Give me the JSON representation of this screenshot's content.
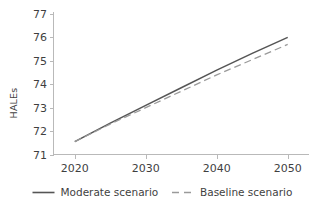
{
  "chart_data": {
    "type": "line",
    "title": "",
    "xlabel": "",
    "ylabel": "HALEs",
    "xlim": [
      2017,
      2053
    ],
    "ylim": [
      71,
      77
    ],
    "grid": false,
    "legend_position": "bottom",
    "x": [
      2020,
      2025,
      2030,
      2035,
      2040,
      2045,
      2050
    ],
    "xticks": [
      "2020",
      "2030",
      "2040",
      "2050"
    ],
    "xtick_values": [
      2020,
      2030,
      2040,
      2050
    ],
    "yticks": [
      "71",
      "72",
      "73",
      "74",
      "75",
      "76",
      "77"
    ],
    "ytick_values": [
      71,
      72,
      73,
      74,
      75,
      76,
      77
    ],
    "series": [
      {
        "name": "Moderate scenario",
        "style": "solid",
        "color": "#555555",
        "values": [
          71.55,
          72.34,
          73.1,
          73.85,
          74.6,
          75.32,
          76.0
        ]
      },
      {
        "name": "Baseline scenario",
        "style": "dashed",
        "color": "#9a9a9a",
        "values": [
          71.55,
          72.3,
          73.0,
          73.7,
          74.4,
          75.05,
          75.7
        ]
      }
    ]
  },
  "legend": {
    "items": [
      {
        "label": "Moderate scenario",
        "style": "solid",
        "color": "#555555"
      },
      {
        "label": "Baseline scenario",
        "style": "dashed",
        "color": "#9a9a9a"
      }
    ]
  },
  "axes": {
    "y_title": "HALEs"
  }
}
